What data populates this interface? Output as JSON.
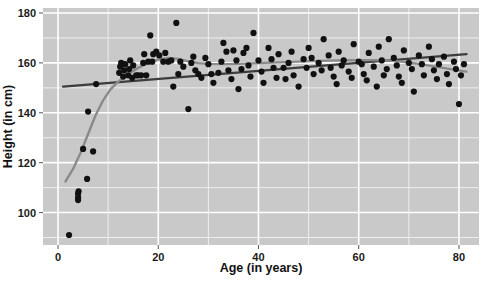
{
  "chart_data": {
    "type": "scatter",
    "title": "",
    "xlabel": "Age (in years)",
    "ylabel": "Height (in cm)",
    "xlim": [
      -3,
      84
    ],
    "ylim": [
      87,
      182
    ],
    "xticks": [
      0,
      20,
      40,
      60,
      80
    ],
    "xtick_labels": [
      "0",
      "20",
      "40",
      "60",
      "80"
    ],
    "yticks": [
      100,
      120,
      140,
      160,
      180
    ],
    "ytick_labels": [
      "100",
      "120",
      "140",
      "160",
      "180"
    ],
    "grid": true,
    "grid_major_color": "#ffffff",
    "grid_minor_color": "#eeeeee",
    "panel_background": "#c9c9c9",
    "legend": "none",
    "point_color": "#111111",
    "point_size": 3.1,
    "series": [
      {
        "name": "observations",
        "points": [
          [
            2.2,
            91.0
          ],
          [
            4.0,
            106.0
          ],
          [
            4.0,
            107.5
          ],
          [
            4.0,
            105.0
          ],
          [
            4.1,
            108.5
          ],
          [
            5.0,
            125.5
          ],
          [
            7.0,
            124.5
          ],
          [
            5.8,
            113.5
          ],
          [
            6.0,
            140.5
          ],
          [
            7.6,
            151.5
          ],
          [
            12.2,
            156.0
          ],
          [
            12.4,
            158.5
          ],
          [
            12.6,
            160.0
          ],
          [
            13.0,
            154.5
          ],
          [
            13.2,
            157.0
          ],
          [
            13.4,
            159.5
          ],
          [
            14.0,
            155.0
          ],
          [
            14.2,
            157.5
          ],
          [
            14.4,
            161.0
          ],
          [
            14.8,
            154.0
          ],
          [
            15.0,
            159.0
          ],
          [
            15.6,
            155.0
          ],
          [
            16.0,
            155.0
          ],
          [
            16.6,
            155.0
          ],
          [
            17.0,
            160.0
          ],
          [
            17.2,
            163.5
          ],
          [
            17.6,
            155.0
          ],
          [
            18.0,
            160.5
          ],
          [
            18.4,
            171.0
          ],
          [
            18.8,
            160.5
          ],
          [
            19.0,
            163.5
          ],
          [
            19.6,
            164.5
          ],
          [
            20.2,
            163.0
          ],
          [
            21.0,
            160.5
          ],
          [
            21.4,
            164.0
          ],
          [
            22.0,
            160.5
          ],
          [
            22.6,
            161.0
          ],
          [
            23.0,
            150.5
          ],
          [
            23.6,
            176.0
          ],
          [
            24.0,
            155.5
          ],
          [
            24.4,
            160.5
          ],
          [
            25.0,
            158.5
          ],
          [
            26.0,
            141.5
          ],
          [
            26.6,
            160.0
          ],
          [
            27.0,
            162.5
          ],
          [
            27.4,
            157.0
          ],
          [
            28.0,
            155.5
          ],
          [
            28.6,
            154.0
          ],
          [
            29.4,
            162.0
          ],
          [
            30.0,
            159.5
          ],
          [
            30.6,
            155.5
          ],
          [
            31.0,
            152.0
          ],
          [
            32.0,
            156.0
          ],
          [
            32.6,
            160.5
          ],
          [
            33.0,
            168.0
          ],
          [
            33.6,
            164.5
          ],
          [
            34.0,
            157.0
          ],
          [
            34.6,
            153.5
          ],
          [
            35.0,
            165.0
          ],
          [
            35.6,
            161.0
          ],
          [
            36.0,
            149.5
          ],
          [
            36.6,
            157.5
          ],
          [
            37.0,
            164.0
          ],
          [
            37.6,
            166.0
          ],
          [
            38.0,
            159.0
          ],
          [
            38.4,
            154.5
          ],
          [
            39.0,
            172.0
          ],
          [
            40.0,
            161.0
          ],
          [
            40.6,
            156.5
          ],
          [
            41.0,
            152.0
          ],
          [
            42.0,
            166.0
          ],
          [
            42.6,
            161.5
          ],
          [
            43.0,
            158.0
          ],
          [
            43.6,
            154.0
          ],
          [
            44.0,
            163.5
          ],
          [
            45.0,
            158.0
          ],
          [
            45.4,
            153.5
          ],
          [
            46.0,
            160.0
          ],
          [
            46.6,
            164.5
          ],
          [
            47.0,
            155.0
          ],
          [
            48.0,
            150.5
          ],
          [
            49.0,
            161.5
          ],
          [
            49.6,
            158.0
          ],
          [
            50.0,
            166.0
          ],
          [
            50.6,
            162.0
          ],
          [
            51.0,
            155.5
          ],
          [
            52.0,
            160.0
          ],
          [
            52.6,
            157.0
          ],
          [
            53.0,
            169.5
          ],
          [
            54.0,
            163.0
          ],
          [
            54.4,
            158.0
          ],
          [
            55.0,
            154.5
          ],
          [
            55.6,
            151.5
          ],
          [
            56.0,
            164.5
          ],
          [
            56.6,
            159.0
          ],
          [
            57.0,
            161.0
          ],
          [
            58.0,
            156.5
          ],
          [
            58.6,
            154.0
          ],
          [
            59.0,
            167.5
          ],
          [
            60.0,
            160.5
          ],
          [
            60.6,
            159.5
          ],
          [
            61.0,
            155.5
          ],
          [
            61.6,
            153.0
          ],
          [
            62.0,
            164.0
          ],
          [
            63.0,
            158.5
          ],
          [
            63.6,
            150.5
          ],
          [
            64.0,
            166.5
          ],
          [
            64.6,
            161.0
          ],
          [
            65.0,
            155.0
          ],
          [
            65.6,
            157.5
          ],
          [
            66.0,
            169.5
          ],
          [
            67.0,
            162.0
          ],
          [
            67.6,
            159.0
          ],
          [
            68.0,
            154.5
          ],
          [
            68.6,
            152.0
          ],
          [
            69.0,
            165.0
          ],
          [
            70.0,
            160.0
          ],
          [
            70.6,
            157.5
          ],
          [
            71.0,
            148.5
          ],
          [
            72.0,
            163.0
          ],
          [
            72.6,
            159.5
          ],
          [
            73.0,
            155.0
          ],
          [
            74.0,
            166.5
          ],
          [
            74.6,
            161.5
          ],
          [
            75.0,
            157.0
          ],
          [
            75.6,
            153.5
          ],
          [
            76.0,
            159.5
          ],
          [
            77.0,
            162.5
          ],
          [
            77.6,
            155.5
          ],
          [
            78.0,
            151.5
          ],
          [
            79.0,
            160.5
          ],
          [
            79.4,
            157.5
          ],
          [
            80.0,
            143.5
          ],
          [
            80.4,
            155.0
          ],
          [
            81.0,
            159.5
          ]
        ]
      }
    ],
    "fits": [
      {
        "name": "linear-regression",
        "type": "line",
        "color": "#3d3d3d",
        "width": 2.4,
        "points": [
          [
            1.0,
            150.5
          ],
          [
            81.5,
            163.5
          ]
        ]
      },
      {
        "name": "loess-smoother",
        "type": "curve",
        "color": "#8a8a8a",
        "width": 2.4,
        "points": [
          [
            1.5,
            112.5
          ],
          [
            3.0,
            117.5
          ],
          [
            4.5,
            124.0
          ],
          [
            6.0,
            131.5
          ],
          [
            7.5,
            139.0
          ],
          [
            9.0,
            145.0
          ],
          [
            10.5,
            149.5
          ],
          [
            12.0,
            152.5
          ],
          [
            14.0,
            155.5
          ],
          [
            16.0,
            158.0
          ],
          [
            18.0,
            160.0
          ],
          [
            20.0,
            161.3
          ],
          [
            22.0,
            162.0
          ],
          [
            24.0,
            161.6
          ],
          [
            26.0,
            160.6
          ],
          [
            28.0,
            159.9
          ],
          [
            30.0,
            159.6
          ],
          [
            33.0,
            159.5
          ],
          [
            36.0,
            159.6
          ],
          [
            40.0,
            159.9
          ],
          [
            44.0,
            160.2
          ],
          [
            48.0,
            160.5
          ],
          [
            52.0,
            160.8
          ],
          [
            56.0,
            161.0
          ],
          [
            60.0,
            161.1
          ],
          [
            63.0,
            161.1
          ],
          [
            66.0,
            160.9
          ],
          [
            69.0,
            160.4
          ],
          [
            72.0,
            159.6
          ],
          [
            75.0,
            158.6
          ],
          [
            78.0,
            157.6
          ],
          [
            81.5,
            156.5
          ]
        ]
      }
    ]
  },
  "layout": {
    "plot_left": 43,
    "plot_right": 479,
    "plot_top": 8,
    "plot_bottom": 245,
    "xaxis_label_y": 272,
    "yaxis_label_x": 12
  }
}
